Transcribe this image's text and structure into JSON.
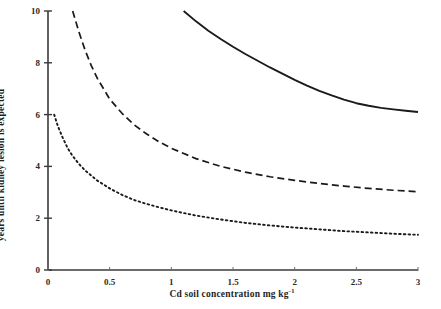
{
  "chart_data": {
    "type": "line",
    "title": "",
    "xlabel": "Cd soil concentration mg kg",
    "xlabel_superscript": "-1",
    "ylabel": "years until kidney lesion is expected",
    "xlim": [
      0,
      3
    ],
    "ylim": [
      0,
      10
    ],
    "xticks": [
      0,
      0.5,
      1,
      1.5,
      2,
      2.5,
      3
    ],
    "xtick_labels": [
      "0",
      "0.5",
      "1",
      "1.5",
      "2",
      "2.5",
      "3"
    ],
    "yticks": [
      0,
      2,
      4,
      6,
      8,
      10
    ],
    "ytick_labels": [
      "0",
      "2",
      "4",
      "6",
      "8",
      "10"
    ],
    "grid": false,
    "legend": "none",
    "series": [
      {
        "name": "upper-curve",
        "style": "solid",
        "color": "#1a1a1a",
        "points": [
          {
            "x": 1.1,
            "y": 10.0
          },
          {
            "x": 1.2,
            "y": 9.6
          },
          {
            "x": 1.3,
            "y": 9.24
          },
          {
            "x": 1.4,
            "y": 8.92
          },
          {
            "x": 1.5,
            "y": 8.62
          },
          {
            "x": 1.6,
            "y": 8.34
          },
          {
            "x": 1.7,
            "y": 8.08
          },
          {
            "x": 1.8,
            "y": 7.82
          },
          {
            "x": 1.9,
            "y": 7.58
          },
          {
            "x": 2.0,
            "y": 7.34
          },
          {
            "x": 2.1,
            "y": 7.12
          },
          {
            "x": 2.2,
            "y": 6.92
          },
          {
            "x": 2.3,
            "y": 6.74
          },
          {
            "x": 2.4,
            "y": 6.58
          },
          {
            "x": 2.5,
            "y": 6.44
          },
          {
            "x": 2.6,
            "y": 6.34
          },
          {
            "x": 2.7,
            "y": 6.26
          },
          {
            "x": 2.8,
            "y": 6.2
          },
          {
            "x": 2.9,
            "y": 6.15
          },
          {
            "x": 3.0,
            "y": 6.1
          }
        ]
      },
      {
        "name": "middle-curve",
        "style": "dashed",
        "color": "#1a1a1a",
        "points": [
          {
            "x": 0.2,
            "y": 10.0
          },
          {
            "x": 0.25,
            "y": 9.2
          },
          {
            "x": 0.3,
            "y": 8.5
          },
          {
            "x": 0.35,
            "y": 7.9
          },
          {
            "x": 0.4,
            "y": 7.4
          },
          {
            "x": 0.5,
            "y": 6.6
          },
          {
            "x": 0.6,
            "y": 6.05
          },
          {
            "x": 0.7,
            "y": 5.6
          },
          {
            "x": 0.8,
            "y": 5.25
          },
          {
            "x": 0.9,
            "y": 4.95
          },
          {
            "x": 1.0,
            "y": 4.7
          },
          {
            "x": 1.2,
            "y": 4.3
          },
          {
            "x": 1.4,
            "y": 4.0
          },
          {
            "x": 1.6,
            "y": 3.78
          },
          {
            "x": 1.8,
            "y": 3.6
          },
          {
            "x": 2.0,
            "y": 3.46
          },
          {
            "x": 2.2,
            "y": 3.34
          },
          {
            "x": 2.4,
            "y": 3.24
          },
          {
            "x": 2.6,
            "y": 3.15
          },
          {
            "x": 2.8,
            "y": 3.08
          },
          {
            "x": 3.0,
            "y": 3.02
          }
        ]
      },
      {
        "name": "lower-curve",
        "style": "dotted",
        "color": "#1a1a1a",
        "points": [
          {
            "x": 0.05,
            "y": 6.0
          },
          {
            "x": 0.08,
            "y": 5.55
          },
          {
            "x": 0.12,
            "y": 5.1
          },
          {
            "x": 0.16,
            "y": 4.7
          },
          {
            "x": 0.2,
            "y": 4.4
          },
          {
            "x": 0.25,
            "y": 4.1
          },
          {
            "x": 0.3,
            "y": 3.85
          },
          {
            "x": 0.4,
            "y": 3.45
          },
          {
            "x": 0.5,
            "y": 3.15
          },
          {
            "x": 0.6,
            "y": 2.9
          },
          {
            "x": 0.7,
            "y": 2.7
          },
          {
            "x": 0.8,
            "y": 2.55
          },
          {
            "x": 0.9,
            "y": 2.42
          },
          {
            "x": 1.0,
            "y": 2.3
          },
          {
            "x": 1.2,
            "y": 2.1
          },
          {
            "x": 1.4,
            "y": 1.95
          },
          {
            "x": 1.6,
            "y": 1.82
          },
          {
            "x": 1.8,
            "y": 1.72
          },
          {
            "x": 2.0,
            "y": 1.64
          },
          {
            "x": 2.2,
            "y": 1.57
          },
          {
            "x": 2.4,
            "y": 1.5
          },
          {
            "x": 2.6,
            "y": 1.45
          },
          {
            "x": 2.8,
            "y": 1.4
          },
          {
            "x": 3.0,
            "y": 1.36
          }
        ]
      }
    ]
  }
}
